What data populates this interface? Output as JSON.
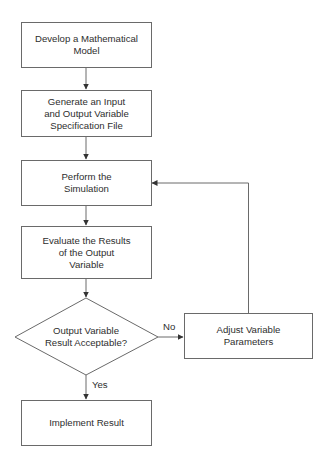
{
  "diagram": {
    "type": "flowchart",
    "nodes": [
      {
        "id": "develop-model",
        "shape": "rectangle",
        "label": "Develop a Mathematical\nModel"
      },
      {
        "id": "generate-spec",
        "shape": "rectangle",
        "label": "Generate an Input\nand Output Variable\nSpecification File"
      },
      {
        "id": "perform-simulation",
        "shape": "rectangle",
        "label": "Perform the\nSimulation"
      },
      {
        "id": "evaluate-results",
        "shape": "rectangle",
        "label": "Evaluate the Results\nof the Output\nVariable"
      },
      {
        "id": "acceptable-decision",
        "shape": "diamond",
        "label": "Output Variable\nResult Acceptable?"
      },
      {
        "id": "adjust-parameters",
        "shape": "rectangle",
        "label": "Adjust Variable\nParameters"
      },
      {
        "id": "implement-result",
        "shape": "rectangle",
        "label": "Implement Result"
      }
    ],
    "edges": [
      {
        "from": "develop-model",
        "to": "generate-spec",
        "label": ""
      },
      {
        "from": "generate-spec",
        "to": "perform-simulation",
        "label": ""
      },
      {
        "from": "perform-simulation",
        "to": "evaluate-results",
        "label": ""
      },
      {
        "from": "evaluate-results",
        "to": "acceptable-decision",
        "label": ""
      },
      {
        "from": "acceptable-decision",
        "to": "adjust-parameters",
        "label": "No"
      },
      {
        "from": "acceptable-decision",
        "to": "implement-result",
        "label": "Yes"
      },
      {
        "from": "adjust-parameters",
        "to": "perform-simulation",
        "label": ""
      }
    ],
    "edge_labels": {
      "no": "No",
      "yes": "Yes"
    },
    "colors": {
      "stroke": "#6a6a6a",
      "text": "#2e2e2e",
      "background": "#ffffff"
    }
  }
}
